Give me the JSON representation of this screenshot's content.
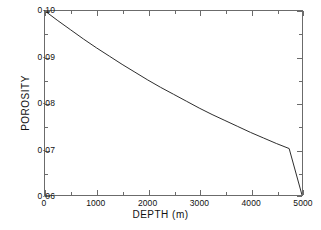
{
  "chart_data": {
    "type": "line",
    "title": "",
    "xlabel": "DEPTH  (m)",
    "ylabel": "POROSITY",
    "xlim": [
      0,
      5000
    ],
    "ylim": [
      0.06,
      0.1
    ],
    "grid": false,
    "legend": null,
    "x_ticks": [
      0,
      1000,
      2000,
      3000,
      4000,
      5000
    ],
    "x_tick_labels": [
      "0",
      "1000",
      "2000",
      "3000",
      "4000",
      "5000"
    ],
    "x_minor_ticks": [
      500,
      1500,
      2500,
      3500,
      4500
    ],
    "y_ticks": [
      0.06,
      0.07,
      0.08,
      0.09,
      0.1
    ],
    "y_tick_labels": [
      "0·06",
      "0·07",
      "0·08",
      "0·09",
      "0·10"
    ],
    "y_minor_ticks": [
      0.065,
      0.075,
      0.085,
      0.095
    ],
    "line_color": "#2b2b2b",
    "line_width": 1,
    "series": [
      {
        "name": "porosity-depth",
        "x": [
          0,
          250,
          500,
          750,
          1000,
          1250,
          1500,
          1750,
          2000,
          2250,
          2500,
          2750,
          3000,
          3250,
          3500,
          3750,
          4000,
          4250,
          4500,
          4750,
          5000
        ],
        "y": [
          0.1,
          0.0979,
          0.0959,
          0.0939,
          0.092,
          0.0902,
          0.0884,
          0.0867,
          0.085,
          0.0834,
          0.0819,
          0.0804,
          0.0789,
          0.0775,
          0.0762,
          0.0749,
          0.0736,
          0.0724,
          0.0712,
          0.0701,
          0.06
        ]
      }
    ]
  },
  "axes": {
    "x_title": "DEPTH  (m)",
    "y_title": "POROSITY"
  }
}
